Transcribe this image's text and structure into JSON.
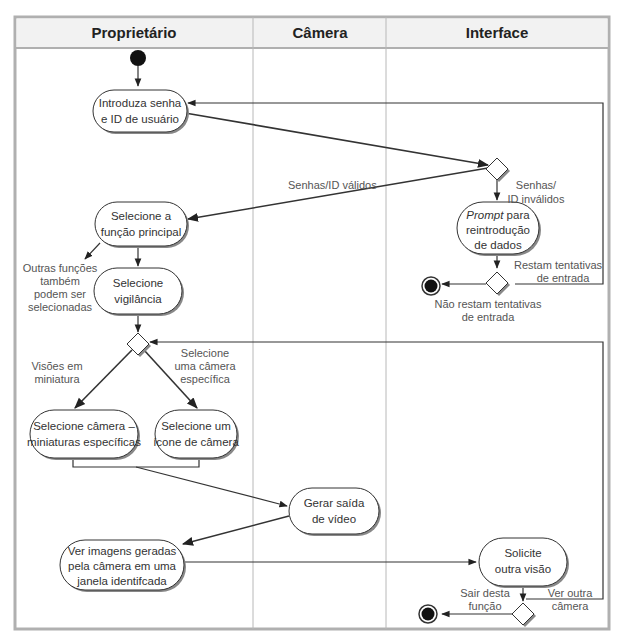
{
  "diagram": {
    "type": "uml-activity-diagram-with-swimlanes",
    "lanes": [
      {
        "id": "proprietario",
        "title": "Proprietário"
      },
      {
        "id": "camera",
        "title": "Câmera"
      },
      {
        "id": "interface",
        "title": "Interface"
      }
    ],
    "nodes": {
      "introduza": {
        "lines": [
          "Introduza senha",
          "e ID de usuário"
        ]
      },
      "selecione_funcao": {
        "lines": [
          "Selecione a",
          "função principal"
        ]
      },
      "selecione_vigilancia": {
        "lines": [
          "Selecione",
          "vigilância"
        ]
      },
      "prompt": {
        "line1_italic": "Prompt",
        "line1_rest": " para",
        "lines": [
          "reintrodução",
          "de dados"
        ]
      },
      "selecione_camera_miniaturas": {
        "lines": [
          "Selecione câmera –",
          "miniaturas específicas"
        ]
      },
      "selecione_icone": {
        "lines": [
          "Selecione um",
          "ícone de câmera"
        ]
      },
      "gerar_saida": {
        "lines": [
          "Gerar saída",
          "de vídeo"
        ]
      },
      "ver_imagens": {
        "lines": [
          "Ver imagens geradas",
          "pela câmera em uma",
          "janela identifcada"
        ]
      },
      "solicite": {
        "lines": [
          "Solicite",
          "outra visão"
        ]
      }
    },
    "labels": {
      "senhas_validos": "Senhas/ID válidos",
      "senhas_invalidos": [
        "Senhas/",
        "ID inválidos"
      ],
      "outras_funcoes": [
        "Outras funções",
        "também",
        "podem ser",
        "selecionadas"
      ],
      "restam_tentativas": [
        "Restam tentativas",
        "de entrada"
      ],
      "nao_restam": [
        "Não restam tentativas",
        "de entrada"
      ],
      "visoes_miniatura": [
        "Visões em",
        "miniatura"
      ],
      "selecione_camera_especifica": [
        "Selecione",
        "uma câmera",
        "específica"
      ],
      "sair_funcao": [
        "Sair desta",
        "função"
      ],
      "ver_outra": [
        "Ver outra",
        "câmera"
      ]
    },
    "colors": {
      "border": "#b5b5b5",
      "header_bg": "#f2f2f2",
      "line": "#333333",
      "node_fill": "#ffffff",
      "node_shadow": "#888888",
      "start_fill": "#111111"
    }
  }
}
